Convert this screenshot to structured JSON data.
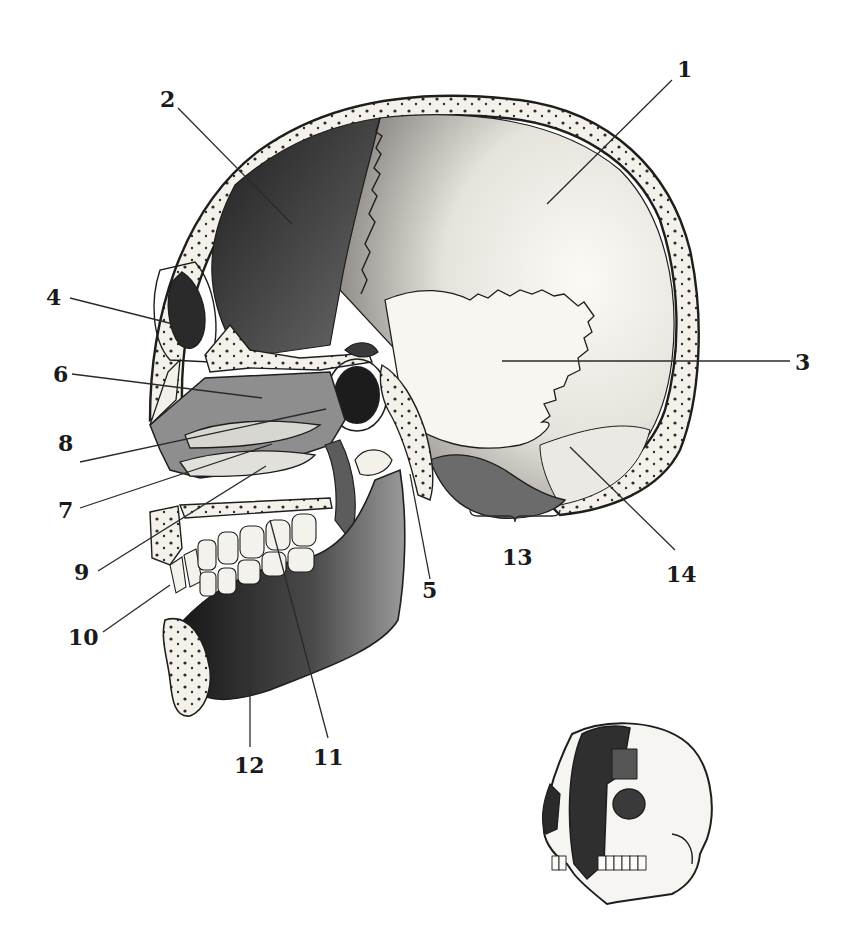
{
  "figure": {
    "type": "anatomical-illustration",
    "inset": "small 3/4 view of skull showing section plane"
  },
  "labels": [
    {
      "id": "1",
      "text": "1",
      "x": 677,
      "y": 77,
      "line": [
        672,
        80,
        547,
        204
      ]
    },
    {
      "id": "2",
      "text": "2",
      "x": 160,
      "y": 107,
      "line": [
        178,
        108,
        292,
        224
      ]
    },
    {
      "id": "3",
      "text": "3",
      "x": 795,
      "y": 370,
      "line": [
        790,
        361,
        502,
        361
      ]
    },
    {
      "id": "4",
      "text": "4",
      "x": 46,
      "y": 305,
      "line": [
        70,
        298,
        177,
        325
      ]
    },
    {
      "id": "5",
      "text": "5",
      "x": 422,
      "y": 598,
      "line": [
        430,
        579,
        410,
        474
      ]
    },
    {
      "id": "6",
      "text": "6",
      "x": 53,
      "y": 382,
      "line": [
        72,
        374,
        262,
        398
      ]
    },
    {
      "id": "7",
      "text": "7",
      "x": 58,
      "y": 518,
      "line": [
        80,
        508,
        272,
        444
      ]
    },
    {
      "id": "8",
      "text": "8",
      "x": 58,
      "y": 451,
      "line": [
        80,
        462,
        326,
        409
      ]
    },
    {
      "id": "9",
      "text": "9",
      "x": 74,
      "y": 580,
      "line": [
        98,
        571,
        266,
        466
      ]
    },
    {
      "id": "10",
      "text": "10",
      "x": 68,
      "y": 645,
      "line": [
        103,
        632,
        170,
        585
      ]
    },
    {
      "id": "11",
      "text": "11",
      "x": 313,
      "y": 765,
      "line": [
        328,
        738,
        270,
        520
      ]
    },
    {
      "id": "12",
      "text": "12",
      "x": 234,
      "y": 773,
      "line": [
        250,
        747,
        250,
        690
      ]
    },
    {
      "id": "13",
      "text": "13",
      "x": 502,
      "y": 565,
      "bracket": [
        470,
        510,
        560,
        510
      ]
    },
    {
      "id": "14",
      "text": "14",
      "x": 666,
      "y": 582,
      "line": [
        675,
        550,
        570,
        447
      ]
    }
  ],
  "colors": {
    "background": "#ffffff",
    "ink": "#1a1a1a",
    "bone_light": "#f3f1ea",
    "bone_shadow": "#3a3a3a"
  }
}
